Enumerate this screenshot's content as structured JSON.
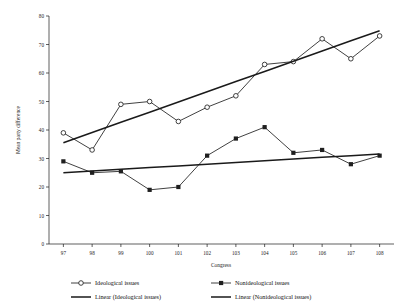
{
  "chart_data": {
    "type": "line",
    "title": "",
    "xlabel": "Congress",
    "ylabel": "Mean party difference",
    "categories": [
      "97",
      "98",
      "99",
      "100",
      "101",
      "102",
      "103",
      "104",
      "105",
      "106",
      "107",
      "108"
    ],
    "xlim": [
      96.5,
      108.5
    ],
    "ylim": [
      0,
      80
    ],
    "yticks": [
      0,
      10,
      20,
      30,
      40,
      50,
      60,
      70,
      80
    ],
    "grid": false,
    "legend_position": "bottom",
    "series": [
      {
        "name": "Ideological issues",
        "marker": "open-circle",
        "values": [
          39,
          33,
          49,
          50,
          43,
          48,
          52,
          63,
          64,
          72,
          65,
          73
        ]
      },
      {
        "name": "Nonideological issues",
        "marker": "filled-square",
        "values": [
          29,
          25,
          25.5,
          19,
          20,
          31,
          37,
          41,
          32,
          33,
          28,
          31
        ]
      },
      {
        "name": "Linear (Ideological issues)",
        "marker": "none",
        "trend": true,
        "values": [
          35.5,
          39.1,
          42.7,
          46.2,
          49.8,
          53.4,
          57.0,
          60.5,
          64.1,
          67.7,
          71.3,
          74.8
        ]
      },
      {
        "name": "Linear (Nonideological issues)",
        "marker": "none",
        "trend": true,
        "values": [
          25.0,
          25.6,
          26.2,
          26.8,
          27.4,
          28.0,
          28.6,
          29.2,
          29.8,
          30.4,
          31.0,
          31.6
        ]
      }
    ]
  },
  "axis": {
    "x_title": "Congress",
    "y_title": "Mean party difference",
    "y_ticks": [
      "0",
      "10",
      "20",
      "30",
      "40",
      "50",
      "60",
      "70",
      "80"
    ],
    "x_ticks": [
      "97",
      "98",
      "99",
      "100",
      "101",
      "102",
      "103",
      "104",
      "105",
      "106",
      "107",
      "108"
    ]
  },
  "legend": {
    "items": [
      {
        "label": "Ideological issues",
        "marker": "open-circle"
      },
      {
        "label": "Nonideological issues",
        "marker": "filled-square"
      },
      {
        "label": "Linear (Ideological issues)",
        "marker": "line"
      },
      {
        "label": "Linear (Nonideological issues)",
        "marker": "line"
      }
    ]
  },
  "colors": {
    "axis": "#1a1a1a",
    "series_line": "#2b2b2b",
    "trend_line": "#1a1a1a",
    "background": "#ffffff"
  }
}
